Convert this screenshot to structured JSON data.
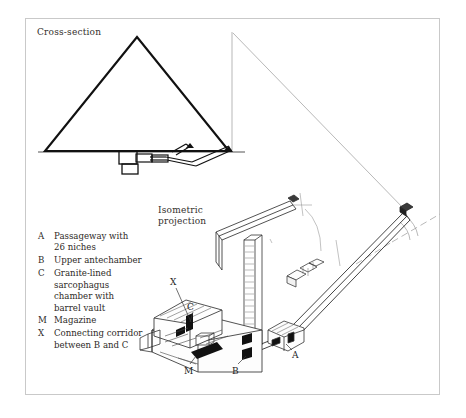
{
  "figure": {
    "title_cross_section": "Cross-section",
    "title_isometric": "Isometric\nprojection"
  },
  "legend": {
    "entries": [
      {
        "key": "A",
        "text": "Passageway with\n26 niches"
      },
      {
        "key": "B",
        "text": "Upper antechamber"
      },
      {
        "key": "C",
        "text": "Granite-lined\nsarcophagus\nchamber with\nbarrel vault"
      },
      {
        "key": "M",
        "text": "Magazine"
      },
      {
        "key": "X",
        "text": "Connecting corridor\nbetween B and C"
      }
    ]
  },
  "callouts": {
    "x": "X",
    "c": "C",
    "m": "M",
    "b": "B",
    "a": "A"
  },
  "colors": {
    "ink": "#1a1a1a",
    "frame": "#c9c9c9",
    "paper": "#ffffff",
    "light_line": "#8a8a8a",
    "text": "#2e2a27"
  }
}
